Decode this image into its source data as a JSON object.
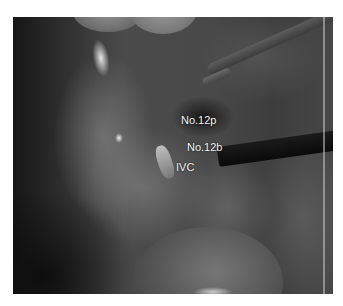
{
  "figure": {
    "labels": {
      "no12p": "No.12p",
      "no12b": "No.12b",
      "ivc": "IVC"
    }
  }
}
